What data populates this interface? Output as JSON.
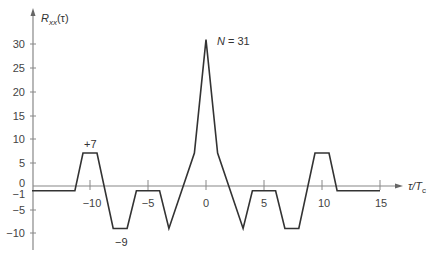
{
  "chart_data": {
    "type": "line",
    "title": "",
    "xlabel": "τ/T_c",
    "ylabel": "R_xx(τ)",
    "xlim": [
      -15,
      15
    ],
    "ylim": [
      -10,
      30
    ],
    "x_ticks": [
      -10,
      -5,
      0,
      5,
      10,
      15
    ],
    "y_ticks": [
      30,
      25,
      20,
      15,
      10,
      5,
      0,
      -1,
      -5,
      -10
    ],
    "grid": false,
    "legend": null,
    "series": [
      {
        "name": "R_xx(τ)",
        "points": [
          [
            -15,
            -1
          ],
          [
            -11.3,
            -1
          ],
          [
            -10.6,
            7
          ],
          [
            -9.4,
            7
          ],
          [
            -8,
            -9
          ],
          [
            -6.8,
            -9
          ],
          [
            -6,
            -1
          ],
          [
            -4,
            -1
          ],
          [
            -3.2,
            -9
          ],
          [
            -1,
            7
          ],
          [
            0,
            31
          ],
          [
            1,
            7
          ],
          [
            3.2,
            -9
          ],
          [
            4,
            -1
          ],
          [
            6,
            -1
          ],
          [
            6.8,
            -9
          ],
          [
            8,
            -9
          ],
          [
            9.4,
            7
          ],
          [
            10.6,
            7
          ],
          [
            11.3,
            -1
          ],
          [
            15,
            -1
          ]
        ]
      }
    ],
    "annotations": [
      {
        "text": "N = 31",
        "x": 0,
        "y": 31
      },
      {
        "text": "+7",
        "x": -10,
        "y": 7
      },
      {
        "text": "−9",
        "x": -7.4,
        "y": -9
      }
    ]
  },
  "labels": {
    "y_axis": "R",
    "y_axis_sub": "xx",
    "y_axis_arg": "(τ)",
    "x_axis": "τ/T",
    "x_axis_sub": "c",
    "peak": "N = 31",
    "plus7": "+7",
    "minus9": "−9",
    "yticks": [
      "30",
      "25",
      "20",
      "15",
      "10",
      "5",
      "0",
      "−1",
      "−5",
      "−10"
    ],
    "xticks": [
      "−10",
      "−5",
      "0",
      "5",
      "10",
      "15"
    ]
  },
  "colors": {
    "axis": "#777777",
    "line": "#333333",
    "text": "#444444"
  }
}
